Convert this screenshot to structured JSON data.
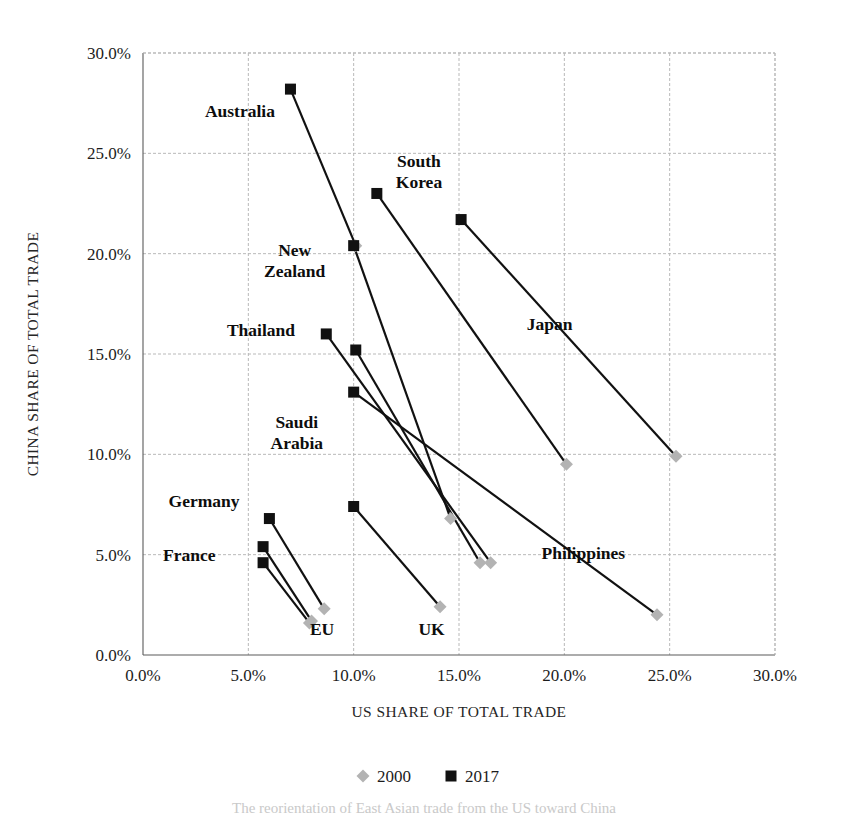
{
  "figure": {
    "caption_partial": "The reorientation of East Asian trade from the US toward China"
  },
  "legend": {
    "position": "bottom-center",
    "entries": [
      {
        "label": "2000",
        "marker": "diamond",
        "color": "#b3b3b3"
      },
      {
        "label": "2017",
        "marker": "square",
        "color": "#111111"
      }
    ]
  },
  "axes": {
    "xlabel": "US SHARE OF TOTAL TRADE",
    "ylabel": "CHINA SHARE OF TOTAL TRADE",
    "xticks": [
      "0.0%",
      "5.0%",
      "10.0%",
      "15.0%",
      "20.0%",
      "25.0%",
      "30.0%"
    ],
    "yticks": [
      "0.0%",
      "5.0%",
      "10.0%",
      "15.0%",
      "20.0%",
      "25.0%",
      "30.0%"
    ]
  },
  "chart_data": {
    "type": "scatter",
    "title": "",
    "subtitle": "",
    "xlabel": "US SHARE OF TOTAL TRADE",
    "ylabel": "CHINA SHARE OF TOTAL TRADE",
    "xlim": [
      0,
      30
    ],
    "ylim": [
      0,
      30
    ],
    "xtick_values": [
      0,
      5,
      10,
      15,
      20,
      25,
      30
    ],
    "ytick_values": [
      0,
      5,
      10,
      15,
      20,
      25,
      30
    ],
    "grid": true,
    "legend_position": "bottom-center",
    "series": [
      {
        "name": "2000",
        "marker": "diamond",
        "color": "#b3b3b3"
      },
      {
        "name": "2017",
        "marker": "square",
        "color": "#111111"
      }
    ],
    "units": "percent",
    "points": [
      {
        "label": "Australia",
        "label_x": 4.6,
        "label_y": 26.8,
        "x_2000": 10.1,
        "y_2000": 20.4,
        "x_2017": 7.0,
        "y_2017": 28.2
      },
      {
        "label": "South Korea",
        "label_x": 13.1,
        "label_y": 24.3,
        "x_2000": 20.1,
        "y_2000": 9.5,
        "x_2017": 11.1,
        "y_2017": 23.0
      },
      {
        "label": "Japan",
        "label_x": 19.3,
        "label_y": 16.2,
        "x_2000": 25.3,
        "y_2000": 9.9,
        "x_2017": 15.1,
        "y_2017": 21.7
      },
      {
        "label": "New Zealand",
        "label_x": 7.2,
        "label_y": 19.9,
        "x_2000": 14.6,
        "y_2000": 6.8,
        "x_2017": 10.0,
        "y_2017": 20.4
      },
      {
        "label": "Thailand",
        "label_x": 5.6,
        "label_y": 15.9,
        "x_2000": 16.5,
        "y_2000": 4.6,
        "x_2017": 8.7,
        "y_2017": 16.0
      },
      {
        "label": "Saudi Arabia",
        "label_x": 7.3,
        "label_y": 11.3,
        "x_2000": 16.0,
        "y_2000": 4.6,
        "x_2017": 10.1,
        "y_2017": 15.2
      },
      {
        "label": "Philippines",
        "label_x": 20.9,
        "label_y": 4.8,
        "x_2000": 24.4,
        "y_2000": 2.0,
        "x_2017": 10.0,
        "y_2017": 13.1
      },
      {
        "label": "Germany",
        "label_x": 2.9,
        "label_y": 7.4,
        "x_2000": 8.6,
        "y_2000": 2.3,
        "x_2017": 6.0,
        "y_2017": 6.8
      },
      {
        "label": "France",
        "label_x": 2.2,
        "label_y": 4.7,
        "x_2000": 8.0,
        "y_2000": 1.7,
        "x_2017": 5.7,
        "y_2017": 5.4
      },
      {
        "label": "EU",
        "label_x": 8.5,
        "label_y": 1.0,
        "x_2000": 7.9,
        "y_2000": 1.6,
        "x_2017": 5.7,
        "y_2017": 4.6
      },
      {
        "label": "UK",
        "label_x": 13.7,
        "label_y": 1.0,
        "x_2000": 14.1,
        "y_2000": 2.4,
        "x_2017": 10.0,
        "y_2017": 7.4
      }
    ]
  }
}
